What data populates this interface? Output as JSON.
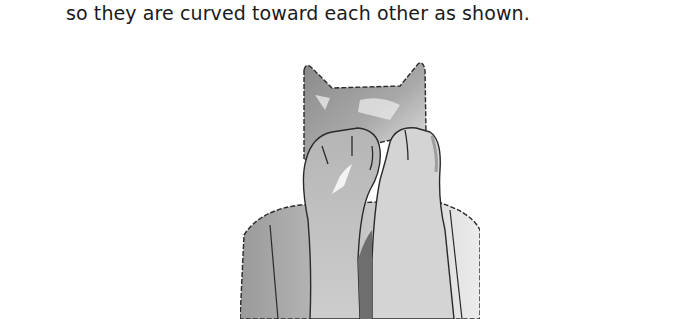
{
  "page": {
    "caption": "so they are curved toward each other as shown."
  },
  "illustration": {
    "subject": "cat-puppet-with-paws-curved-together",
    "style": "grayscale watercolor with stitched seams",
    "colors": {
      "outline": "#2a2a2a",
      "shade_dark": "#6e6e6e",
      "shade_mid": "#9c9c9c",
      "shade_light": "#cfcfcf",
      "highlight": "#f2f2f2"
    }
  }
}
